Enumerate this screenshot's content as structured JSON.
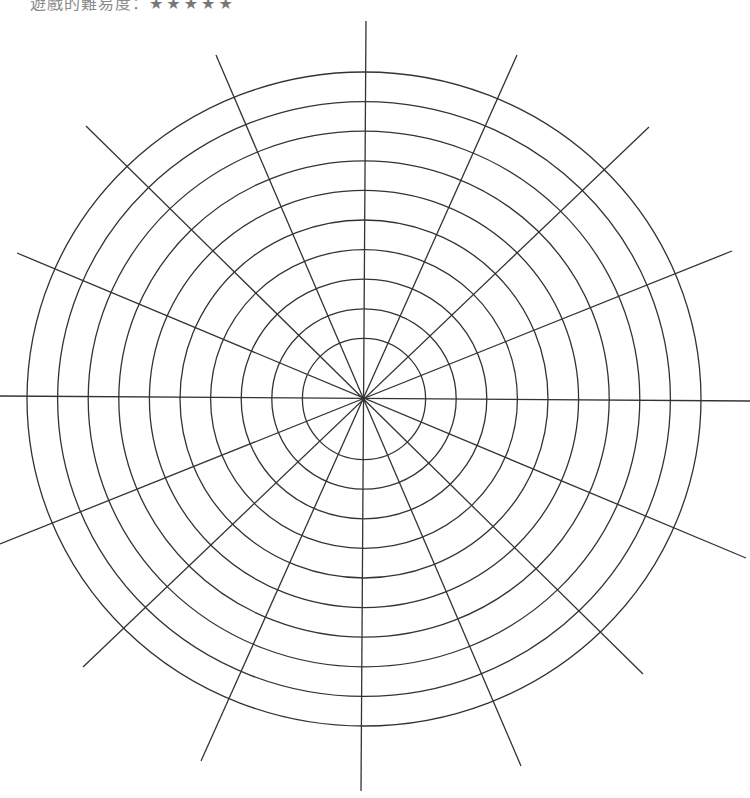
{
  "caption": {
    "label": "遊戲的難易度：",
    "stars": "★★★★★"
  },
  "diagram": {
    "type": "polar-grid",
    "center": [
      364,
      399
    ],
    "rings": 10,
    "ring_radii_x": [
      61.6,
      92.2,
      122.8,
      153.4,
      184.0,
      214.6,
      245.2,
      275.8,
      306.4,
      337.0
    ],
    "ring_radii_y": [
      60.6,
      90.2,
      119.8,
      149.4,
      179.0,
      208.6,
      238.2,
      267.8,
      297.4,
      327.0
    ],
    "spokes": 16,
    "spoke_endpoints": [
      [
        [
          366,
          21
        ],
        [
          361,
          791
        ]
      ],
      [
        [
          0,
          396
        ],
        [
          750,
          401
        ]
      ],
      [
        [
          216,
          55
        ],
        [
          521,
          766
        ]
      ],
      [
        [
          517,
          55
        ],
        [
          201,
          761
        ]
      ],
      [
        [
          86,
          126
        ],
        [
          643,
          674
        ]
      ],
      [
        [
          649,
          127
        ],
        [
          83,
          667
        ]
      ],
      [
        [
          17,
          253
        ],
        [
          746,
          558
        ]
      ],
      [
        [
          732,
          251
        ],
        [
          0,
          544
        ]
      ]
    ],
    "line_color": "#333333"
  }
}
